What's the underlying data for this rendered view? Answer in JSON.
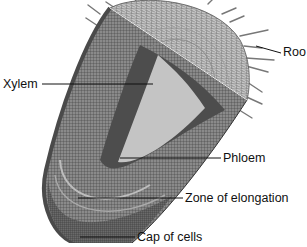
{
  "diagram": {
    "labels": [
      {
        "id": "root-hairs",
        "text": "Roo",
        "x": 283,
        "y": 46
      },
      {
        "id": "xylem",
        "text": "Xylem",
        "x": 3,
        "y": 78
      },
      {
        "id": "phloem",
        "text": "Phloem",
        "x": 223,
        "y": 152
      },
      {
        "id": "zone-of-elongation",
        "text": "Zone of elongation",
        "x": 185,
        "y": 192
      },
      {
        "id": "cap-of-cells",
        "text": "Cap of cells",
        "x": 137,
        "y": 231
      }
    ],
    "leader_lines": [
      {
        "id": "root-hairs",
        "x1": 256,
        "y1": 46,
        "x2": 281,
        "y2": 53
      },
      {
        "id": "xylem",
        "x1": 42,
        "y1": 84,
        "x2": 153,
        "y2": 84
      },
      {
        "id": "phloem",
        "x1": 120,
        "y1": 158,
        "x2": 221,
        "y2": 158
      },
      {
        "id": "zone-of-elongation",
        "x1": 78,
        "y1": 198,
        "x2": 183,
        "y2": 198
      },
      {
        "id": "cap-of-cells",
        "x1": 80,
        "y1": 237,
        "x2": 135,
        "y2": 237
      }
    ],
    "colors": {
      "cortex": "#7a7a7a",
      "stele_light": "#cfcfcf",
      "stele_dark": "#4a4a4a",
      "cap_section": "#b8b8b8",
      "root_tip": "#5a5a5a",
      "label": "#111111",
      "line": "#111111"
    }
  }
}
